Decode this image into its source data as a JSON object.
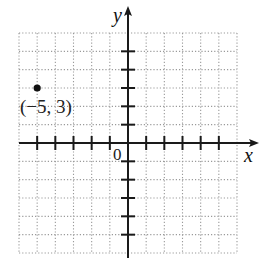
{
  "chart_data": {
    "type": "scatter",
    "title": "",
    "xlabel": "x",
    "ylabel": "y",
    "xlim": [
      -6,
      6
    ],
    "ylim": [
      -6,
      6
    ],
    "grid": true,
    "grid_style": "dotted",
    "origin_label": "0",
    "points": [
      {
        "x": -5,
        "y": 3,
        "label": "(−5, 3)"
      }
    ],
    "tick_marks": {
      "x": [
        -5,
        -4,
        -3,
        -2,
        -1,
        1,
        2,
        3,
        4,
        5
      ],
      "y": [
        -5,
        -4,
        -3,
        -2,
        -1,
        1,
        2,
        3,
        4,
        5
      ]
    }
  },
  "labels": {
    "x_axis": "x",
    "y_axis": "y",
    "origin": "0",
    "point": "(−5, 3)"
  },
  "colors": {
    "axis": "#1a1a1a",
    "grid": "#9a9a9a",
    "point": "#111111"
  }
}
